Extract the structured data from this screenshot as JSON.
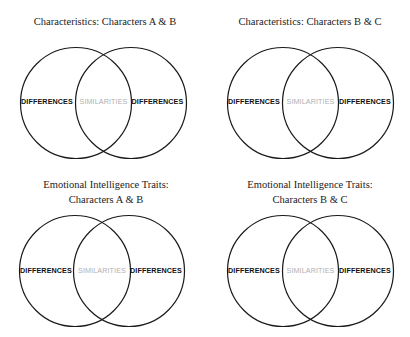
{
  "diagrams": [
    {
      "title_lines": [
        "Characteristics: Characters A & B"
      ],
      "left_label": "DIFFERENCES",
      "center_label": "SIMILARITIES",
      "right_label": "DIFFERENCES"
    },
    {
      "title_lines": [
        "Characteristics: Characters B & C"
      ],
      "left_label": "DIFFERENCES",
      "center_label": "SIMILARITIES",
      "right_label": "DIFFERENCES"
    },
    {
      "title_lines": [
        "Emotional Intelligence Traits:",
        "Characters A & B"
      ],
      "left_label": "DIFFERENCES",
      "center_label": "SIMILARITIES",
      "right_label": "DIFFERENCES"
    },
    {
      "title_lines": [
        "Emotional Intelligence Traits:",
        "Characters B & C"
      ],
      "left_label": "DIFFERENCES",
      "center_label": "SIMILARITIES",
      "right_label": "DIFFERENCES"
    }
  ],
  "colors": {
    "line": "#1a1a1a",
    "differences_text": "#111111",
    "similarities_text": "#b0b0b0",
    "background": "#ffffff"
  }
}
